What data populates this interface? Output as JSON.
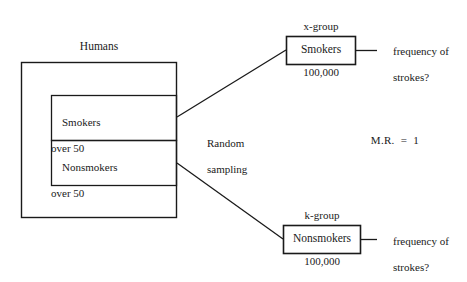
{
  "diagram": {
    "title_label": "Humans",
    "population": {
      "outer_label": "Humans",
      "strata": [
        {
          "name": "smokers-over-50",
          "line1": "Smokers",
          "line2": "over 50"
        },
        {
          "name": "nonsmokers-over-50",
          "line1": "Nonsmokers",
          "line2": "over 50"
        }
      ]
    },
    "sampling": {
      "line1": "Random",
      "line2": "sampling"
    },
    "groups": [
      {
        "key": "x-group",
        "group_label": "x-group",
        "box_label": "Smokers",
        "count": "100,000",
        "outcome_line1": "frequency of",
        "outcome_line2": "strokes?"
      },
      {
        "key": "k-group",
        "group_label": "k-group",
        "box_label": "Nonsmokers",
        "count": "100,000",
        "outcome_line1": "frequency of",
        "outcome_line2": "strokes?"
      }
    ],
    "measure": {
      "label": "M.R.  =  1"
    },
    "style": {
      "stroke": "#1a1a1a",
      "background": "#ffffff"
    }
  }
}
